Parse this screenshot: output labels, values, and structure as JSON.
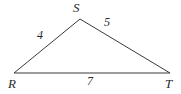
{
  "figure": {
    "type": "triangle-diagram",
    "background_color": "#ffffff",
    "stroke_color": "#3a3a3a",
    "text_color": "#2b2b2b",
    "vertices": [
      {
        "name": "R",
        "label": "R",
        "x": 14,
        "y": 73
      },
      {
        "name": "S",
        "label": "S",
        "x": 80,
        "y": 19
      },
      {
        "name": "T",
        "label": "T",
        "x": 170,
        "y": 73
      }
    ],
    "sides": [
      {
        "name": "RS",
        "from": "R",
        "to": "S",
        "length_label": "4"
      },
      {
        "name": "ST",
        "from": "S",
        "to": "T",
        "length_label": "5"
      },
      {
        "name": "RT",
        "from": "R",
        "to": "T",
        "length_label": "7"
      }
    ],
    "polygon_points": "14,73 80,19 170,73"
  }
}
